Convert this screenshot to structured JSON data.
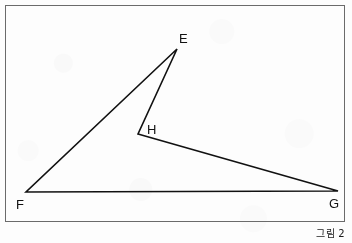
{
  "figure": {
    "caption": "그림 2",
    "frame": {
      "x": 5.5,
      "y": 5.5,
      "width": 339,
      "height": 216,
      "stroke_color": "#6b6b6b",
      "stroke_width": 1
    },
    "background_color": "#fdfdfd",
    "line_color": "#111111",
    "line_width": 1.6,
    "shape_name": "quadrilateral-efgh",
    "vertices": [
      {
        "id": "E",
        "label": "E",
        "x": 177,
        "y": 49,
        "label_x": 179,
        "label_y": 43
      },
      {
        "id": "F",
        "label": "F",
        "x": 26,
        "y": 192,
        "label_x": 16,
        "label_y": 209
      },
      {
        "id": "G",
        "label": "G",
        "x": 338,
        "y": 191,
        "label_x": 329,
        "label_y": 208
      },
      {
        "id": "H",
        "label": "H",
        "x": 138,
        "y": 134,
        "label_x": 147,
        "label_y": 134
      }
    ],
    "edges": [
      {
        "id": "EF",
        "from": "E",
        "to": "F"
      },
      {
        "id": "FG",
        "from": "F",
        "to": "G"
      },
      {
        "id": "GH",
        "from": "G",
        "to": "H"
      },
      {
        "id": "HE",
        "from": "H",
        "to": "E"
      }
    ],
    "path_d": "M 177 49 L 26 192 L 338 191 L 138 134 Z"
  }
}
